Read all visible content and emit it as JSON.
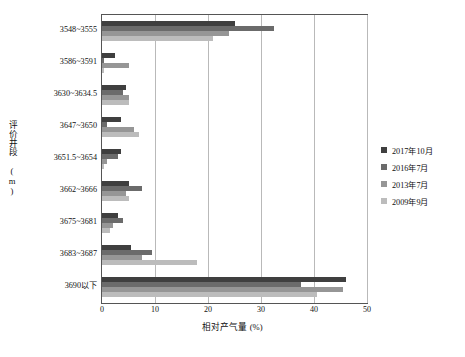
{
  "chart_data": {
    "type": "bar",
    "orientation": "horizontal",
    "title": "",
    "xlabel": "相对产气量 (%)",
    "ylabel": "评价井段 (m)",
    "xlim": [
      0,
      50
    ],
    "xticks": [
      0,
      10,
      20,
      30,
      40,
      50
    ],
    "grid": true,
    "legend_position": "right",
    "categories": [
      "3548~3555",
      "3586~3591",
      "3630~3634.5",
      "3647~3650",
      "3651.5~3654",
      "3662~3666",
      "3675~3681",
      "3683~3687",
      "3690以下"
    ],
    "series": [
      {
        "name": "2017年10月",
        "color": "#3f3f3f",
        "values": [
          25.0,
          2.5,
          4.5,
          3.5,
          3.5,
          5.0,
          3.0,
          5.5,
          46.0
        ]
      },
      {
        "name": "2016年7月",
        "color": "#6b6b6b",
        "values": [
          32.5,
          0.4,
          4.0,
          1.0,
          3.0,
          7.5,
          4.0,
          9.5,
          37.5
        ]
      },
      {
        "name": "2013年7月",
        "color": "#969696",
        "values": [
          24.0,
          5.0,
          5.0,
          6.0,
          1.0,
          4.5,
          2.0,
          7.5,
          45.5
        ]
      },
      {
        "name": "2009年9月",
        "color": "#bcbcbc",
        "values": [
          21.0,
          0.4,
          5.0,
          7.0,
          0.4,
          5.0,
          1.5,
          18.0,
          40.5
        ]
      }
    ]
  }
}
